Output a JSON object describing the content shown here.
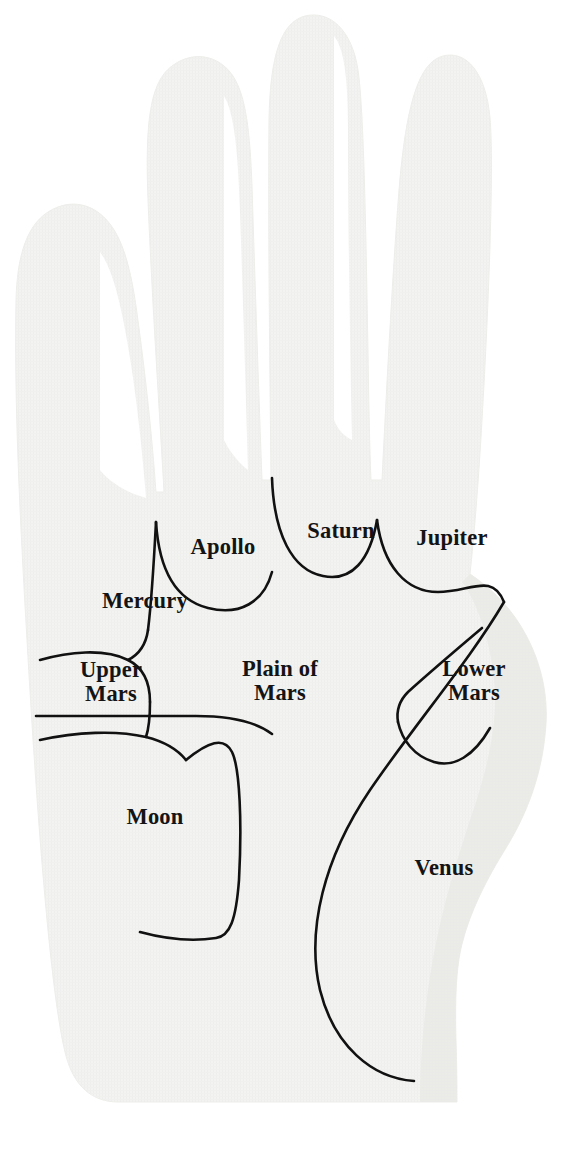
{
  "diagram": {
    "background_color": "#ffffff",
    "hand_fill_color": "#f2f2f0",
    "hand_shadow_color": "#e6e6e3",
    "line_color": "#111111",
    "text_color": "#141414",
    "line_width": 2.6
  },
  "labels": [
    {
      "id": "mercury",
      "text": "Mercury",
      "lines": [
        "Mercury"
      ],
      "x": 90,
      "y": 589,
      "width": 110,
      "font_size": 22.5
    },
    {
      "id": "apollo",
      "text": "Apollo",
      "lines": [
        "Apollo"
      ],
      "x": 175,
      "y": 535,
      "width": 96,
      "font_size": 22.5
    },
    {
      "id": "saturn",
      "text": "Saturn",
      "lines": [
        "Saturn"
      ],
      "x": 296,
      "y": 519,
      "width": 90,
      "font_size": 22.5
    },
    {
      "id": "jupiter",
      "text": "Jupiter",
      "lines": [
        "Jupiter"
      ],
      "x": 406,
      "y": 526,
      "width": 92,
      "font_size": 22.5
    },
    {
      "id": "upper-mars",
      "text": "Upper Mars",
      "lines": [
        "Upper",
        "Mars"
      ],
      "x": 63,
      "y": 658,
      "width": 96,
      "font_size": 22.5
    },
    {
      "id": "plain-of-mars",
      "text": "Plain of Mars",
      "lines": [
        "Plain of",
        "Mars"
      ],
      "x": 219,
      "y": 657,
      "width": 122,
      "font_size": 22.5
    },
    {
      "id": "lower-mars",
      "text": "Lower Mars",
      "lines": [
        "Lower",
        "Mars"
      ],
      "x": 425,
      "y": 657,
      "width": 98,
      "font_size": 22.5
    },
    {
      "id": "moon",
      "text": "Moon",
      "lines": [
        "Moon"
      ],
      "x": 115,
      "y": 805,
      "width": 80,
      "font_size": 22.5
    },
    {
      "id": "venus",
      "text": "Venus",
      "lines": [
        "Venus"
      ],
      "x": 402,
      "y": 856,
      "width": 84,
      "font_size": 22.5
    }
  ],
  "shapes": {
    "hand_outline": "M 27 640 C 20 520 14 400 16 300 C 17 258 26 226 48 212 C 70 198 94 203 110 224 C 124 242 131 272 136 306 C 146 378 152 437 156 492 L 164 492 C 160 420 152 300 148 200 C 145 122 150 82 172 66 C 193 50 219 55 233 76 C 246 96 250 132 252 186 C 255 282 259 400 262 480 L 271 480 C 270 380 268 230 269 120 C 270 56 281 22 305 16 C 330 10 352 30 358 70 C 364 110 366 240 368 352 C 369 420 370 458 371 480 L 382 480 C 386 400 392 280 399 190 C 406 104 419 62 443 56 C 466 50 486 72 490 118 C 494 164 489 300 482 420 C 478 490 474 536 470 574 C 488 586 508 604 522 628 C 540 658 548 692 546 724 C 543 772 528 812 506 848 C 486 880 470 912 462 944 C 456 968 455 1000 456 1040 C 457 1072 457 1092 457 1102 L 118 1102 C 92 1102 74 1086 66 1056 C 50 996 36 800 27 640 Z",
    "thumb_web_shadow": "M 470 574 C 488 586 508 604 522 628 C 540 658 548 692 546 724 C 543 772 528 812 506 848 C 486 880 470 912 462 944 C 456 968 455 1000 456 1040 C 457 1072 457 1092 457 1102 L 420 1102 C 420 1060 424 1010 432 964 C 442 906 458 856 474 808 C 490 760 498 716 494 680 C 490 640 478 604 462 582 Z",
    "finger_gap_pinky": "M 146 498 C 142 448 136 392 128 346 C 120 300 112 268 100 252 L 100 470 C 108 480 120 488 134 494 Z",
    "finger_gap_ring": "M 248 470 C 246 396 243 300 240 212 C 238 150 234 112 224 96 L 224 440 C 230 452 238 462 248 470 Z",
    "finger_gap_middle": "M 352 440 C 350 344 348 218 348 128 C 348 78 344 48 334 36 L 334 420 C 338 430 344 436 352 440 Z",
    "mount_arcs": [
      {
        "id": "arc-mercury-apollo",
        "d": "M 156 522 C 154 560 152 598 148 630"
      },
      {
        "id": "arc-apollo",
        "d": "M 156 522 C 159 570 176 600 208 608 C 240 616 264 602 272 572"
      },
      {
        "id": "arc-saturn",
        "d": "M 272 478 C 274 534 292 570 323 576 C 352 582 370 560 377 520"
      },
      {
        "id": "arc-jupiter",
        "d": "M 377 520 C 383 566 406 592 438 592 C 470 592 492 572 504 602"
      }
    ],
    "palm_lines": [
      {
        "id": "mercury-lower-boundary",
        "d": "M 148 630 C 146 644 140 654 128 660"
      },
      {
        "id": "upper-mars-top",
        "d": "M 40 660 C 68 652 104 648 128 660 C 144 668 150 684 150 702"
      },
      {
        "id": "upper-mars-right",
        "d": "M 150 702 C 150 718 149 728 146 737"
      },
      {
        "id": "head-line",
        "d": "M 36 716 L 196 716 C 230 716 256 722 272 734"
      },
      {
        "id": "heart-line",
        "d": "M 40 740 C 76 732 116 730 146 737 C 166 742 178 750 186 760"
      },
      {
        "id": "moon-boundary",
        "d": "M 186 760 C 208 742 224 736 232 752 C 240 768 242 824 239 880 C 236 920 230 936 216 938 C 190 942 162 938 140 932"
      },
      {
        "id": "life-line",
        "d": "M 504 602 C 470 660 418 720 370 790 C 324 858 306 930 320 990 C 334 1046 372 1078 414 1081"
      },
      {
        "id": "fate-line-thumb",
        "d": "M 482 628 C 456 650 430 672 408 692 C 400 700 396 710 398 722"
      },
      {
        "id": "lower-mars-bottom",
        "d": "M 398 722 C 402 740 414 756 434 762 C 454 768 474 756 490 728"
      }
    ]
  }
}
